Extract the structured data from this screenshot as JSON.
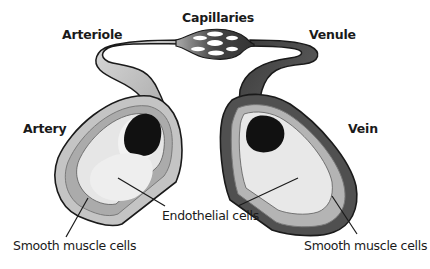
{
  "diagram": {
    "title_labels": {
      "capillaries": "Capillaries",
      "arteriole": "Arteriole",
      "venule": "Venule",
      "artery": "Artery",
      "vein": "Vein"
    },
    "part_labels": {
      "endothelial": "Endothelial cells",
      "smooth_muscle_left": "Smooth muscle cells",
      "smooth_muscle_right": "Smooth muscle cells"
    },
    "colors": {
      "artery_outer": "#c8c8c8",
      "artery_mid": "#b0b0b0",
      "lumen_light": "#eeeeee",
      "blood": "#111111",
      "vein_outer": "#555555",
      "outline": "#1a1a1a"
    }
  }
}
